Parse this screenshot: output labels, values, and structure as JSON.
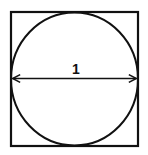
{
  "diagram": {
    "diameter_label": "1",
    "stroke_color": "#111111",
    "background": "#ffffff"
  }
}
